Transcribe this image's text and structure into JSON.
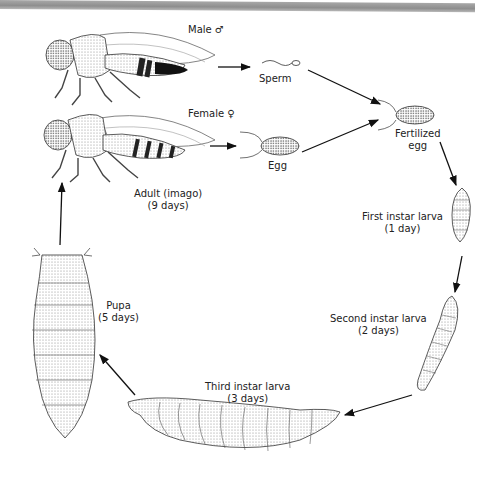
{
  "diagram": {
    "type": "life-cycle",
    "stages": [
      {
        "id": "male",
        "label": "Male",
        "symbol": "♂"
      },
      {
        "id": "female",
        "label": "Female",
        "symbol": "♀"
      },
      {
        "id": "sperm",
        "label": "Sperm"
      },
      {
        "id": "egg",
        "label": "Egg"
      },
      {
        "id": "fertilized_egg",
        "label_line1": "Fertilized",
        "label_line2": "egg"
      },
      {
        "id": "first_instar",
        "label_line1": "First instar larva",
        "label_line2": "(1 day)"
      },
      {
        "id": "second_instar",
        "label_line1": "Second instar larva",
        "label_line2": "(2 days)"
      },
      {
        "id": "third_instar",
        "label_line1": "Third instar larva",
        "label_line2": "(3 days)"
      },
      {
        "id": "pupa",
        "label_line1": "Pupa",
        "label_line2": "(5 days)"
      },
      {
        "id": "adult",
        "label_line1": "Adult (imago)",
        "label_line2": "(9 days)"
      }
    ],
    "flow": [
      [
        "male",
        "sperm"
      ],
      [
        "female",
        "egg"
      ],
      [
        "sperm",
        "fertilized_egg"
      ],
      [
        "egg",
        "fertilized_egg"
      ],
      [
        "fertilized_egg",
        "first_instar"
      ],
      [
        "first_instar",
        "second_instar"
      ],
      [
        "second_instar",
        "third_instar"
      ],
      [
        "third_instar",
        "pupa"
      ],
      [
        "pupa",
        "adult"
      ]
    ]
  },
  "labels": {
    "male": "Male ♂",
    "female": "Female ♀",
    "sperm": "Sperm",
    "egg": "Egg",
    "fertilized_1": "Fertilized",
    "fertilized_2": "egg",
    "first_1": "First instar larva",
    "first_2": "(1 day)",
    "second_1": "Second instar larva",
    "second_2": "(2 days)",
    "third_1": "Third instar larva",
    "third_2": "(3 days)",
    "pupa_1": "Pupa",
    "pupa_2": "(5 days)",
    "adult_1": "Adult (imago)",
    "adult_2": "(9 days)"
  },
  "colors": {
    "ink": "#222222",
    "stipple": "#999999",
    "topbar": "#9a9a9a"
  }
}
